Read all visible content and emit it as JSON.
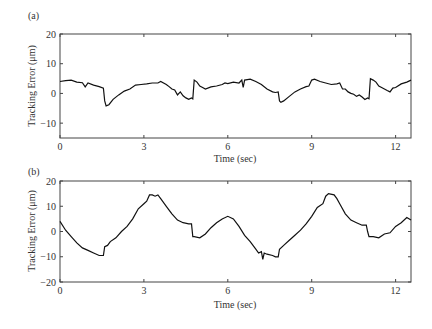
{
  "chart_data": [
    {
      "type": "line",
      "panel_label": "(a)",
      "title": "",
      "xlabel": "Time (sec)",
      "ylabel": "Tracking Error (μm)",
      "xlim": [
        0,
        12.55
      ],
      "ylim": [
        -15,
        20
      ],
      "xticks": [
        0,
        3,
        6,
        9,
        12
      ],
      "yticks": [
        -10,
        0,
        10,
        20
      ],
      "grid": false,
      "series": [
        {
          "name": "tracking error (a)",
          "x": [
            0,
            0.2,
            0.4,
            0.6,
            0.8,
            0.9,
            1.0,
            1.2,
            1.4,
            1.55,
            1.6,
            1.65,
            1.75,
            1.9,
            2.1,
            2.3,
            2.5,
            2.7,
            2.9,
            3.1,
            3.3,
            3.5,
            3.6,
            3.8,
            3.9,
            4.0,
            4.1,
            4.2,
            4.3,
            4.4,
            4.5,
            4.6,
            4.7,
            4.75,
            4.8,
            4.9,
            5.0,
            5.1,
            5.2,
            5.4,
            5.6,
            5.8,
            5.9,
            6.0,
            6.2,
            6.4,
            6.5,
            6.55,
            6.6,
            6.8,
            7.0,
            7.1,
            7.2,
            7.4,
            7.6,
            7.7,
            7.8,
            7.85,
            7.9,
            8.0,
            8.2,
            8.4,
            8.6,
            8.8,
            8.9,
            9.0,
            9.1,
            9.3,
            9.5,
            9.7,
            9.9,
            10.0,
            10.1,
            10.2,
            10.3,
            10.4,
            10.5,
            10.6,
            10.7,
            10.8,
            10.9,
            11.0,
            11.05,
            11.1,
            11.2,
            11.3,
            11.4,
            11.5,
            11.6,
            11.7,
            11.8,
            11.9,
            12.0,
            12.2,
            12.4,
            12.55
          ],
          "y": [
            4,
            4.3,
            4.5,
            3.8,
            3.6,
            2.2,
            3.5,
            2.8,
            2.3,
            1.8,
            -2.5,
            -4.2,
            -3.8,
            -2,
            -0.5,
            0.8,
            1.5,
            2.8,
            3,
            3.2,
            3.5,
            3.5,
            4,
            3,
            2.3,
            1.5,
            1.2,
            -0.5,
            0.5,
            -0.8,
            -1.5,
            -2,
            -1.5,
            -1.8,
            4.5,
            3.8,
            2.5,
            2,
            1.5,
            2.2,
            2.5,
            3,
            3.5,
            3.3,
            3.8,
            3.5,
            4.5,
            2,
            4.5,
            4.8,
            4,
            3.5,
            3,
            1.5,
            0.5,
            0.3,
            0.5,
            -2.5,
            -3,
            -2.5,
            -1,
            0.5,
            1.5,
            2.3,
            2.5,
            4.5,
            4.8,
            4,
            3.5,
            3,
            3.2,
            3.5,
            1.5,
            1.5,
            0.5,
            0,
            -0.3,
            -1,
            -0.5,
            -1.2,
            -2,
            -1.5,
            -1.8,
            5,
            4.5,
            3.8,
            2.5,
            2,
            1.5,
            1,
            0.5,
            1.8,
            2,
            3.2,
            3.8,
            4.5
          ]
        }
      ]
    },
    {
      "type": "line",
      "panel_label": "(b)",
      "title": "",
      "xlabel": "Time (sec)",
      "ylabel": "Tracking Error (μm)",
      "xlim": [
        0,
        12.55
      ],
      "ylim": [
        -20,
        20
      ],
      "xticks": [
        0,
        3,
        6,
        9,
        12
      ],
      "yticks": [
        -20,
        -10,
        0,
        10,
        20
      ],
      "grid": false,
      "series": [
        {
          "name": "tracking error (b)",
          "x": [
            0,
            0.2,
            0.4,
            0.6,
            0.8,
            1.0,
            1.2,
            1.4,
            1.55,
            1.6,
            1.7,
            1.8,
            2.0,
            2.2,
            2.4,
            2.6,
            2.8,
            3.0,
            3.1,
            3.2,
            3.3,
            3.4,
            3.5,
            3.6,
            3.8,
            4.0,
            4.2,
            4.4,
            4.6,
            4.7,
            4.75,
            4.8,
            5.0,
            5.2,
            5.4,
            5.6,
            5.8,
            6.0,
            6.2,
            6.4,
            6.6,
            6.8,
            7.0,
            7.1,
            7.2,
            7.25,
            7.3,
            7.4,
            7.6,
            7.7,
            7.8,
            7.85,
            8.0,
            8.2,
            8.4,
            8.6,
            8.8,
            9.0,
            9.2,
            9.4,
            9.5,
            9.6,
            9.8,
            9.9,
            10.0,
            10.2,
            10.4,
            10.6,
            10.8,
            10.95,
            11.0,
            11.05,
            11.2,
            11.4,
            11.6,
            11.8,
            12.0,
            12.2,
            12.4,
            12.55
          ],
          "y": [
            4,
            0.5,
            -2,
            -4.5,
            -6.5,
            -7.5,
            -8.5,
            -9.5,
            -9.5,
            -6,
            -5.5,
            -4,
            -2.5,
            0,
            2,
            5,
            9,
            11,
            12,
            14.5,
            14.5,
            14,
            14.5,
            13,
            10,
            7,
            4.5,
            3.5,
            3,
            3,
            -2,
            -2,
            -2.5,
            -1,
            1.5,
            3.5,
            5,
            6,
            5,
            2,
            -1.5,
            -4,
            -7,
            -8.5,
            -8,
            -11,
            -8.5,
            -9,
            -9.5,
            -10,
            -10,
            -7,
            -5.5,
            -3.5,
            -1.5,
            0.5,
            3,
            6,
            9.5,
            11,
            14,
            15,
            14.5,
            13,
            11,
            7,
            4.5,
            3.5,
            2.5,
            2.5,
            0,
            -2,
            -2,
            -2.5,
            -1,
            -0.5,
            2,
            3.5,
            5.5,
            4.5
          ]
        }
      ]
    }
  ],
  "colors": {
    "line": "#111111",
    "axis": "#444444",
    "text": "#333333"
  }
}
